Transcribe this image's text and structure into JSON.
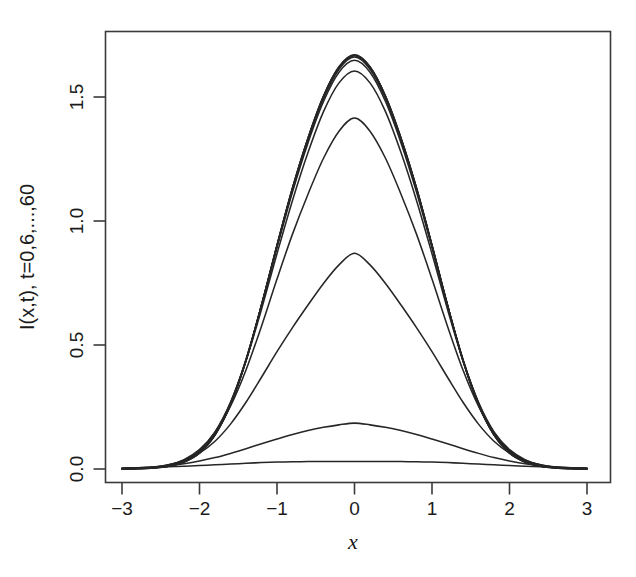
{
  "figure": {
    "background_color": "#ffffff",
    "line_color": "#262626",
    "axis_color": "#3a3a3a"
  },
  "chart_data": {
    "type": "line",
    "title": "",
    "subtitle": "",
    "xlabel": "x",
    "ylabel": "I(x,t), t=0,6,...,60",
    "xlim": [
      -3,
      3
    ],
    "ylim": [
      -0.03,
      1.72
    ],
    "xticks": [
      -3,
      -2,
      -1,
      0,
      1,
      2,
      3
    ],
    "xtick_labels": [
      "−3",
      "−2",
      "−1",
      "0",
      "1",
      "2",
      "3"
    ],
    "yticks": [
      0.0,
      0.5,
      1.0,
      1.5
    ],
    "ytick_labels": [
      "0.0",
      "0.5",
      "1.0",
      "1.5"
    ],
    "grid": false,
    "legend": null,
    "legend_position": "none",
    "annotations": [],
    "x": [
      -3.0,
      -2.8,
      -2.6,
      -2.4,
      -2.2,
      -2.0,
      -1.8,
      -1.6,
      -1.4,
      -1.2,
      -1.0,
      -0.8,
      -0.6,
      -0.4,
      -0.2,
      0.0,
      0.2,
      0.4,
      0.6,
      0.8,
      1.0,
      1.2,
      1.4,
      1.6,
      1.8,
      2.0,
      2.2,
      2.4,
      2.6,
      2.8,
      3.0
    ],
    "series": [
      {
        "name": "t=0",
        "t": 0,
        "peak": 0.03,
        "values": [
          0.004,
          0.005,
          0.007,
          0.009,
          0.011,
          0.014,
          0.017,
          0.02,
          0.023,
          0.026,
          0.028,
          0.029,
          0.03,
          0.03,
          0.03,
          0.03,
          0.03,
          0.03,
          0.03,
          0.029,
          0.028,
          0.026,
          0.023,
          0.02,
          0.017,
          0.014,
          0.011,
          0.009,
          0.007,
          0.005,
          0.004
        ]
      },
      {
        "name": "t=6",
        "t": 6,
        "peak": 0.185,
        "values": [
          0.003,
          0.005,
          0.008,
          0.013,
          0.021,
          0.032,
          0.046,
          0.063,
          0.082,
          0.102,
          0.121,
          0.139,
          0.155,
          0.168,
          0.178,
          0.185,
          0.178,
          0.168,
          0.155,
          0.139,
          0.121,
          0.102,
          0.082,
          0.063,
          0.046,
          0.032,
          0.021,
          0.013,
          0.008,
          0.005,
          0.003
        ]
      },
      {
        "name": "t=12",
        "t": 12,
        "peak": 0.87,
        "values": [
          0.002,
          0.004,
          0.008,
          0.017,
          0.034,
          0.064,
          0.112,
          0.181,
          0.269,
          0.37,
          0.473,
          0.57,
          0.661,
          0.748,
          0.823,
          0.87,
          0.823,
          0.748,
          0.661,
          0.57,
          0.473,
          0.37,
          0.269,
          0.181,
          0.112,
          0.064,
          0.034,
          0.017,
          0.008,
          0.004,
          0.002
        ]
      },
      {
        "name": "t=18",
        "t": 18,
        "peak": 1.415,
        "values": [
          0.001,
          0.003,
          0.007,
          0.017,
          0.038,
          0.078,
          0.147,
          0.253,
          0.399,
          0.576,
          0.766,
          0.947,
          1.108,
          1.253,
          1.362,
          1.415,
          1.362,
          1.253,
          1.108,
          0.947,
          0.766,
          0.576,
          0.399,
          0.253,
          0.147,
          0.078,
          0.038,
          0.017,
          0.007,
          0.003,
          0.001
        ]
      },
      {
        "name": "t=24",
        "t": 24,
        "peak": 1.605,
        "values": [
          0.001,
          0.002,
          0.006,
          0.015,
          0.035,
          0.076,
          0.15,
          0.269,
          0.437,
          0.644,
          0.868,
          1.083,
          1.276,
          1.441,
          1.557,
          1.605,
          1.557,
          1.441,
          1.276,
          1.083,
          0.868,
          0.644,
          0.437,
          0.269,
          0.15,
          0.076,
          0.035,
          0.015,
          0.006,
          0.002,
          0.001
        ]
      },
      {
        "name": "t=30",
        "t": 30,
        "peak": 1.648,
        "values": [
          0.001,
          0.002,
          0.005,
          0.013,
          0.032,
          0.071,
          0.145,
          0.267,
          0.442,
          0.659,
          0.893,
          1.117,
          1.315,
          1.482,
          1.6,
          1.648,
          1.6,
          1.482,
          1.315,
          1.117,
          0.893,
          0.659,
          0.442,
          0.267,
          0.145,
          0.071,
          0.032,
          0.013,
          0.005,
          0.002,
          0.001
        ]
      },
      {
        "name": "t=36",
        "t": 36,
        "peak": 1.661,
        "values": [
          0.001,
          0.002,
          0.005,
          0.012,
          0.03,
          0.068,
          0.141,
          0.263,
          0.44,
          0.66,
          0.898,
          1.126,
          1.326,
          1.494,
          1.612,
          1.661,
          1.612,
          1.494,
          1.326,
          1.126,
          0.898,
          0.66,
          0.44,
          0.263,
          0.141,
          0.068,
          0.03,
          0.012,
          0.005,
          0.002,
          0.001
        ]
      },
      {
        "name": "t=42",
        "t": 42,
        "peak": 1.666,
        "values": [
          0.001,
          0.002,
          0.004,
          0.012,
          0.029,
          0.066,
          0.139,
          0.261,
          0.438,
          0.66,
          0.9,
          1.13,
          1.331,
          1.5,
          1.618,
          1.666,
          1.618,
          1.5,
          1.331,
          1.13,
          0.9,
          0.66,
          0.438,
          0.261,
          0.139,
          0.066,
          0.029,
          0.012,
          0.004,
          0.002,
          0.001
        ]
      },
      {
        "name": "t=48",
        "t": 48,
        "peak": 1.668,
        "values": [
          0.001,
          0.002,
          0.004,
          0.011,
          0.029,
          0.065,
          0.138,
          0.26,
          0.437,
          0.66,
          0.901,
          1.132,
          1.333,
          1.502,
          1.62,
          1.668,
          1.62,
          1.502,
          1.333,
          1.132,
          0.901,
          0.66,
          0.437,
          0.26,
          0.138,
          0.065,
          0.029,
          0.011,
          0.004,
          0.002,
          0.001
        ]
      },
      {
        "name": "t=54",
        "t": 54,
        "peak": 1.669,
        "values": [
          0.001,
          0.002,
          0.004,
          0.011,
          0.028,
          0.065,
          0.137,
          0.259,
          0.437,
          0.66,
          0.901,
          1.133,
          1.334,
          1.503,
          1.621,
          1.669,
          1.621,
          1.503,
          1.334,
          1.133,
          0.901,
          0.66,
          0.437,
          0.259,
          0.137,
          0.065,
          0.028,
          0.011,
          0.004,
          0.002,
          0.001
        ]
      },
      {
        "name": "t=60",
        "t": 60,
        "peak": 1.67,
        "values": [
          0.001,
          0.002,
          0.004,
          0.011,
          0.028,
          0.064,
          0.137,
          0.259,
          0.436,
          0.66,
          0.902,
          1.133,
          1.335,
          1.504,
          1.622,
          1.67,
          1.622,
          1.504,
          1.335,
          1.133,
          0.902,
          0.66,
          0.436,
          0.259,
          0.137,
          0.064,
          0.028,
          0.011,
          0.004,
          0.002,
          0.001
        ]
      }
    ]
  }
}
